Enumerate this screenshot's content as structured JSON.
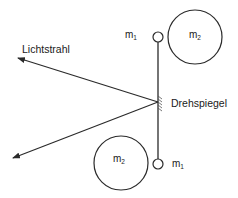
{
  "diagram": {
    "labels": {
      "light_ray": "Lichtstrahl",
      "mirror": "Drehspiegel",
      "mass_small_top": "m",
      "mass_small_top_sub": "1",
      "mass_large_top": "m",
      "mass_large_top_sub": "2",
      "mass_large_bottom": "m",
      "mass_large_bottom_sub": "2",
      "mass_small_bottom": "m",
      "mass_small_bottom_sub": "1"
    },
    "colors": {
      "stroke": "#2a2a2a",
      "background": "#ffffff"
    }
  }
}
